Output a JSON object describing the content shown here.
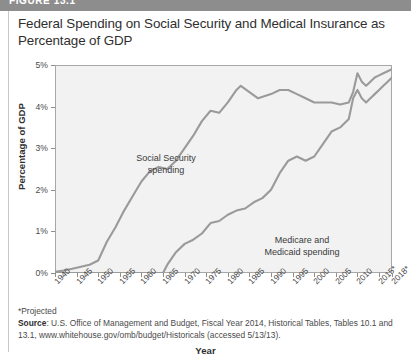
{
  "figure": {
    "number": "FIGURE 13.1",
    "title": "Federal Spending on Social Security and Medical Insurance as Percentage of GDP"
  },
  "footnotes": {
    "projected": "*Projected",
    "source_label": "Source",
    "source_text": ": U.S. Office of Management and Budget, Fiscal Year 2014, Historical Tables, Tables 10.1 and 13.1, www.whitehouse.gov/omb/budget/Historicals (accessed 5/13/13)."
  },
  "chart_data": {
    "type": "line",
    "title": "Federal Spending on Social Security and Medical Insurance as Percentage of GDP",
    "xlabel": "Year",
    "ylabel": "Percentage of GDP",
    "xlim": [
      1940,
      2018
    ],
    "ylim": [
      0,
      5
    ],
    "grid": false,
    "legend_position": "inline-annotations",
    "y_ticks": [
      "0%",
      "1%",
      "2%",
      "3%",
      "4%",
      "5%"
    ],
    "y_tick_values": [
      0,
      1,
      2,
      3,
      4,
      5
    ],
    "x_ticks": [
      "1940",
      "1945",
      "1950",
      "1955",
      "1960",
      "1965",
      "1970",
      "1975",
      "1980",
      "1985",
      "1990",
      "1995",
      "2000",
      "2005",
      "2010",
      "2015*",
      "2018*"
    ],
    "x_tick_values": [
      1940,
      1945,
      1950,
      1955,
      1960,
      1965,
      1970,
      1975,
      1980,
      1985,
      1990,
      1995,
      2000,
      2005,
      2010,
      2015,
      2018
    ],
    "annotations": [
      {
        "text": "Social Security\nspending",
        "x": 1972,
        "y": 4.3
      },
      {
        "text": "Medicare and\nMedicaid spending",
        "x": 1997,
        "y": 2.0
      }
    ],
    "series": [
      {
        "name": "Social Security spending",
        "color": "#9a9a9a",
        "x": [
          1940,
          1942,
          1944,
          1946,
          1948,
          1950,
          1952,
          1954,
          1956,
          1958,
          1960,
          1962,
          1964,
          1966,
          1968,
          1970,
          1972,
          1974,
          1976,
          1978,
          1980,
          1982,
          1983,
          1985,
          1987,
          1990,
          1992,
          1994,
          1996,
          1998,
          2000,
          2002,
          2004,
          2006,
          2008,
          2009,
          2010,
          2011,
          2012,
          2013,
          2014,
          2015,
          2016,
          2017,
          2018
        ],
        "y": [
          0.03,
          0.06,
          0.1,
          0.15,
          0.2,
          0.3,
          0.75,
          1.1,
          1.5,
          1.85,
          2.2,
          2.45,
          2.55,
          2.5,
          2.7,
          3.0,
          3.3,
          3.65,
          3.9,
          3.85,
          4.1,
          4.4,
          4.5,
          4.35,
          4.2,
          4.3,
          4.4,
          4.4,
          4.3,
          4.2,
          4.1,
          4.1,
          4.1,
          4.05,
          4.1,
          4.35,
          4.8,
          4.6,
          4.5,
          4.6,
          4.7,
          4.75,
          4.8,
          4.85,
          4.9
        ],
        "y_display_note": "values plotted against 0-5% axis"
      },
      {
        "name": "Medicare and Medicaid spending",
        "color": "#9a9a9a",
        "x": [
          1940,
          1960,
          1965,
          1966,
          1968,
          1970,
          1972,
          1974,
          1976,
          1978,
          1980,
          1982,
          1984,
          1986,
          1988,
          1990,
          1992,
          1994,
          1996,
          1998,
          2000,
          2002,
          2004,
          2006,
          2008,
          2009,
          2010,
          2011,
          2012,
          2013,
          2014,
          2015,
          2016,
          2017,
          2018
        ],
        "y": [
          0.0,
          0.0,
          0.0,
          0.2,
          0.5,
          0.7,
          0.8,
          0.95,
          1.2,
          1.25,
          1.4,
          1.5,
          1.55,
          1.7,
          1.8,
          2.0,
          2.4,
          2.7,
          2.8,
          2.7,
          2.8,
          3.1,
          3.4,
          3.5,
          3.7,
          4.2,
          4.4,
          4.2,
          4.1,
          4.2,
          4.3,
          4.4,
          4.5,
          4.6,
          4.7
        ]
      }
    ]
  }
}
